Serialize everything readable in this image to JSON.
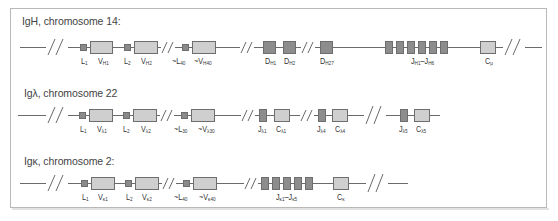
{
  "figure": {
    "rows": [
      {
        "id": "igh",
        "title": "IgH, chromosome 14:",
        "labels": {
          "L1": "L",
          "L1s": "1",
          "V1": "V",
          "V1s": "H1",
          "L2": "L",
          "L2s": "2",
          "V2": "V",
          "V2s": "H2",
          "Ln": "~L",
          "Lns": "40",
          "Vn": "~V",
          "Vns": "H40",
          "D1": "D",
          "D1s": "H1",
          "D2": "D",
          "D2s": "H2",
          "Dn": "D",
          "Dns": "H27",
          "J": "J",
          "Js1": "H1",
          "Jdash": "–J",
          "Js2": "H6",
          "C": "C",
          "Cs": "μ"
        }
      },
      {
        "id": "iglambda",
        "title": "Igλ, chromosome 22",
        "labels": {
          "L1": "L",
          "L1s": "1",
          "V1": "V",
          "V1s": "λ1",
          "L2": "L",
          "L2s": "2",
          "V2": "V",
          "V2s": "λ2",
          "Ln": "~L",
          "Lns": "30",
          "Vn": "~V",
          "Vns": "λ30",
          "J1": "J",
          "J1s": "λ1",
          "C1": "C",
          "C1s": "λ1",
          "J4": "J",
          "J4s": "λ4",
          "C4": "C",
          "C4s": "λ4",
          "J5": "J",
          "J5s": "λ5",
          "C5": "C",
          "C5s": "λ5"
        }
      },
      {
        "id": "igkappa",
        "title": "Igκ, chromosome 2:",
        "labels": {
          "L1": "L",
          "L1s": "1",
          "V1": "V",
          "V1s": "κ1",
          "L2": "L",
          "L2s": "2",
          "V2": "V",
          "V2s": "κ2",
          "Ln": "~L",
          "Lns": "40",
          "Vn": "~V",
          "Vns": "κ40",
          "J": "J",
          "Js1": "κ1",
          "Jdash": "–J",
          "Js2": "κ5",
          "C": "C",
          "Cs": "κ"
        }
      }
    ],
    "colors": {
      "line": "#6a6a6a",
      "v_segment": "#cfcfcf",
      "leader_dj_segment": "#8d8d8d",
      "frame_border": "#b8b8b8"
    }
  }
}
